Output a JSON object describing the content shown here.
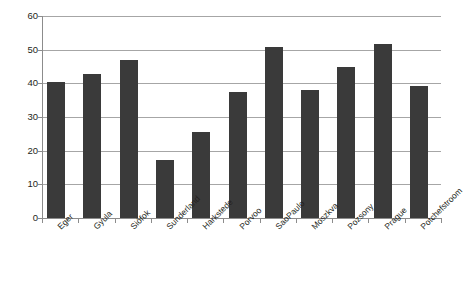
{
  "chart_data": {
    "type": "bar",
    "title": "",
    "xlabel": "",
    "ylabel": "",
    "categories": [
      "Eger",
      "Gyula",
      "Siófok",
      "Sunderland",
      "Harkstede",
      "Porvoo",
      "SaoPaulo",
      "Moszkva",
      "Pozsony",
      "Prague",
      "Potchefstroom"
    ],
    "values": [
      40.5,
      42.8,
      47.0,
      17.3,
      25.6,
      37.4,
      50.7,
      38.1,
      44.8,
      51.6,
      39.2
    ],
    "ylim": [
      0,
      60
    ],
    "ytick_values": [
      0,
      10,
      20,
      30,
      40,
      50,
      60
    ],
    "ytick_labels": [
      "0",
      "10",
      "20",
      "30",
      "40",
      "50",
      "60"
    ],
    "grid": true,
    "grid_axis": "y",
    "legend": false,
    "legend_position": "none",
    "bar_color": "#3a3a3a",
    "grid_color": "#a6a6a6",
    "axis_color": "#8c8c8c",
    "background_color": "#ffffff",
    "xtick_label_rotation": -45
  }
}
